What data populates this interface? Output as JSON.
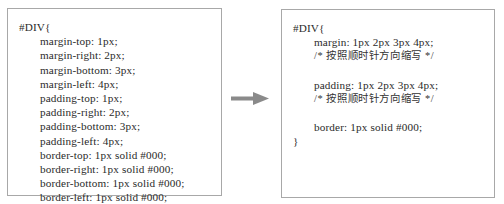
{
  "figure": {
    "before": {
      "selector_open": "#DIV{",
      "lines": [
        "margin-top: 1px;",
        "margin-right: 2px;",
        "margin-bottom: 3px;",
        "margin-left: 4px;",
        "padding-top: 1px;",
        "padding-right: 2px;",
        "padding-bottom: 3px;",
        "padding-left: 4px;",
        "border-top: 1px solid #000;",
        "border-right: 1px solid #000;",
        "border-bottom: 1px solid #000;",
        "border-left: 1px solid #000;"
      ],
      "close": "}"
    },
    "arrow": {
      "icon": "right-arrow-icon",
      "color": "#8a8a8a"
    },
    "after": {
      "selector_open": "#DIV{",
      "margin_line": "margin: 1px 2px 3px 4px;",
      "margin_comment": "/* 按照顺时针方向缩写 */",
      "padding_line": "padding: 1px 2px 3px 4px;",
      "padding_comment": "/* 按照顺时针方向缩写 */",
      "border_line": "border: 1px solid #000;",
      "close": "}"
    }
  }
}
